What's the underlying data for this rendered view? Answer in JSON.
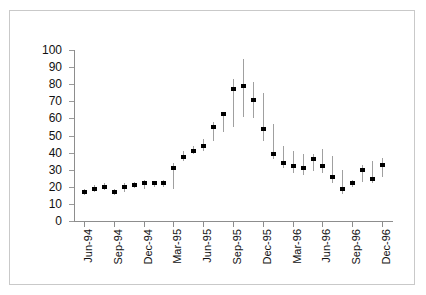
{
  "chart_data": {
    "type": "bar",
    "subtype": "high-low-close vertical bar chart",
    "title": "",
    "xlabel": "",
    "ylabel": "",
    "ylim": [
      0,
      100
    ],
    "yticks": [
      0,
      10,
      20,
      30,
      40,
      50,
      60,
      70,
      80,
      90,
      100
    ],
    "grid": false,
    "legend": null,
    "xtick_labels": [
      "Jun-94",
      "Sep-94",
      "Dec-94",
      "Mar-95",
      "Jun-95",
      "Sep-95",
      "Dec-95",
      "Mar-96",
      "Jun-96",
      "Sep-96",
      "Dec-96"
    ],
    "categories": [
      "Jun-94",
      "Jul-94",
      "Aug-94",
      "Sep-94",
      "Oct-94",
      "Nov-94",
      "Dec-94",
      "Jan-95",
      "Feb-95",
      "Mar-95",
      "Apr-95",
      "May-95",
      "Jun-95",
      "Jul-95",
      "Aug-95",
      "Sep-95",
      "Oct-95",
      "Nov-95",
      "Dec-95",
      "Jan-96",
      "Feb-96",
      "Mar-96",
      "Apr-96",
      "May-96",
      "Jun-96",
      "Jul-96",
      "Aug-96",
      "Sep-96",
      "Oct-96",
      "Nov-96",
      "Dec-96"
    ],
    "series": [
      {
        "name": "High",
        "values": [
          19,
          21,
          22,
          19,
          22,
          23,
          24,
          23,
          24,
          34,
          41,
          44,
          48,
          58,
          64,
          83,
          95,
          81,
          75,
          57,
          44,
          41,
          39,
          39,
          42,
          38,
          30,
          24,
          33,
          35,
          37
        ]
      },
      {
        "name": "Low",
        "values": [
          15,
          17,
          18,
          15,
          17,
          19,
          19,
          20,
          20,
          19,
          35,
          39,
          41,
          47,
          52,
          55,
          61,
          60,
          47,
          36,
          31,
          28,
          27,
          29,
          28,
          22,
          16,
          20,
          23,
          22,
          26
        ]
      },
      {
        "name": "Close",
        "values": [
          17,
          19,
          20,
          17,
          20,
          21,
          22,
          22,
          22,
          31,
          37.5,
          41,
          44,
          55,
          62.5,
          77,
          79,
          70.5,
          54,
          39,
          34,
          32,
          31,
          36,
          32,
          25.5,
          18.5,
          22.5,
          30,
          24.5,
          33
        ]
      }
    ],
    "last_point": {
      "label": "Dec-96",
      "close": 29
    }
  }
}
